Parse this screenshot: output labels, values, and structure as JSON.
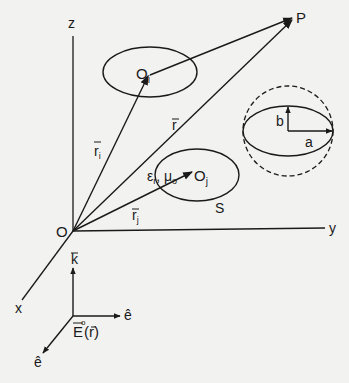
{
  "diagram": {
    "axes": {
      "z": "z",
      "y": "y",
      "x": "x",
      "origin": "O"
    },
    "point": "P",
    "vectors": {
      "r": "r",
      "r_i": "r",
      "r_i_sub": "i",
      "r_j": "r",
      "r_j_sub": "j"
    },
    "scatterers": {
      "upper": {
        "center": "O",
        "center_sub": "i"
      },
      "lower": {
        "center": "O",
        "center_sub": "j",
        "material": "ε",
        "material_sub": "r",
        "material2": "μ",
        "material2_sub": "o",
        "surface": "S"
      }
    },
    "spheroid": {
      "semi_major": "a",
      "semi_minor": "b"
    },
    "incident_wave": {
      "propagation": "k",
      "polarization_h": "ê",
      "polarization_v": "ê",
      "field": "E",
      "field_sup": "o",
      "field_arg": "(r)"
    }
  },
  "colors": {
    "ink": "#1a1a1a",
    "paper": "#f2f2f0"
  }
}
